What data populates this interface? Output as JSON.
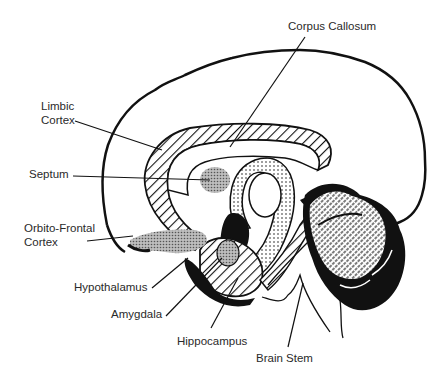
{
  "diagram": {
    "labels": {
      "corpus_callosum": "Corpus Callosum",
      "limbic_cortex_1": "Limbic",
      "limbic_cortex_2": "Cortex",
      "septum": "Septum",
      "orbito_frontal_1": "Orbito-Frontal",
      "orbito_frontal_2": "Cortex",
      "hypothalamus": "Hypothalamus",
      "amygdala": "Amygdala",
      "hippocampus": "Hippocampus",
      "brain_stem": "Brain Stem"
    },
    "colors": {
      "ink": "#111111",
      "label_text": "#2a2a2a",
      "stipple": "#9a9a9a",
      "background": "#ffffff"
    }
  }
}
